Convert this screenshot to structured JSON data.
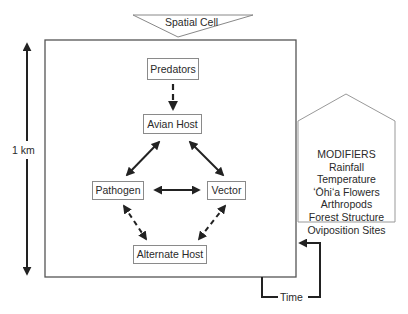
{
  "header": {
    "spatial_cell_label": "Spatial Cell"
  },
  "scale": {
    "label": "1 km"
  },
  "nodes": {
    "predators": "Predators",
    "avian_host": "Avian Host",
    "pathogen": "Pathogen",
    "vector": "Vector",
    "alternate_host": "Alternate Host"
  },
  "modifiers": {
    "title": "MODIFIERS",
    "items": [
      "Rainfall",
      "Temperature",
      "ʻŌhiʻa Flowers",
      "Arthropods",
      "Forest Structure",
      "Oviposition Sites"
    ]
  },
  "time": {
    "label": "Time"
  },
  "colors": {
    "line": "#222222",
    "box_border": "#8a8a8a",
    "frame": "#555555"
  }
}
